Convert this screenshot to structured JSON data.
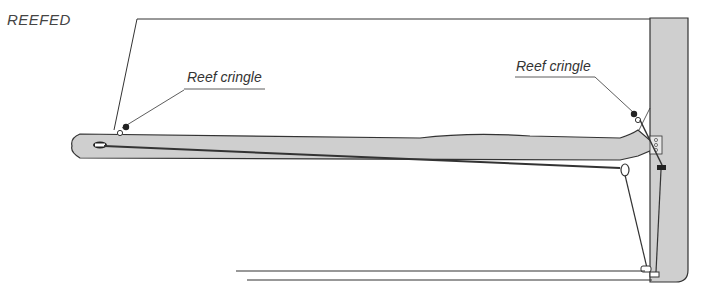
{
  "diagram": {
    "title": "REEFED",
    "labels": {
      "reef_cringle_left": "Reef cringle",
      "reef_cringle_right": "Reef cringle"
    },
    "colors": {
      "spar_fill": "#cfcfcf",
      "line": "#333333",
      "text": "#444444"
    }
  }
}
